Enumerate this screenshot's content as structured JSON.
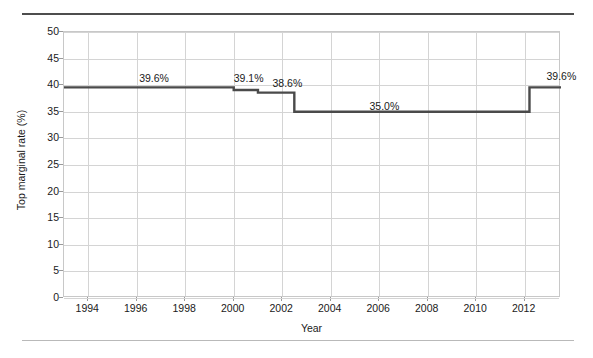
{
  "chart_data": {
    "type": "line",
    "title": "",
    "subtitle": "",
    "xlabel": "Year",
    "ylabel": "Top marginal rate (%)",
    "xlim": [
      1993,
      2013.5
    ],
    "ylim": [
      0,
      50
    ],
    "grid": true,
    "legend": null,
    "line_style": "step-post",
    "line_color": "#4a4a4a",
    "x_ticks": [
      1994,
      1996,
      1998,
      2000,
      2002,
      2004,
      2006,
      2008,
      2010,
      2012
    ],
    "x_tick_labels": [
      "1994",
      "1996",
      "1998",
      "2000",
      "2002",
      "2004",
      "2006",
      "2008",
      "2010",
      "2012"
    ],
    "y_ticks": [
      0,
      5,
      10,
      15,
      20,
      25,
      30,
      35,
      40,
      45,
      50
    ],
    "y_tick_labels": [
      "0",
      "5",
      "10",
      "15",
      "20",
      "25",
      "30",
      "35",
      "40",
      "45",
      "50"
    ],
    "series": [
      {
        "name": "Top marginal rate",
        "steps": [
          {
            "x_start": 1993.0,
            "x_end": 2000.0,
            "value": 39.6
          },
          {
            "x_start": 2000.0,
            "x_end": 2001.0,
            "value": 39.1
          },
          {
            "x_start": 2001.0,
            "x_end": 2002.5,
            "value": 38.6
          },
          {
            "x_start": 2002.5,
            "x_end": 2012.2,
            "value": 35.0
          },
          {
            "x_start": 2012.2,
            "x_end": 2013.5,
            "value": 39.6
          }
        ]
      }
    ],
    "annotations": [
      {
        "text": "39.6%",
        "x": 1996.1,
        "y": 42.2
      },
      {
        "text": "39.1%",
        "x": 2000.0,
        "y": 42.2
      },
      {
        "text": "38.6%",
        "x": 2001.6,
        "y": 41.3
      },
      {
        "text": "35.0%",
        "x": 2005.6,
        "y": 37.0
      },
      {
        "text": "39.6%",
        "x": 2012.9,
        "y": 42.6
      }
    ]
  }
}
